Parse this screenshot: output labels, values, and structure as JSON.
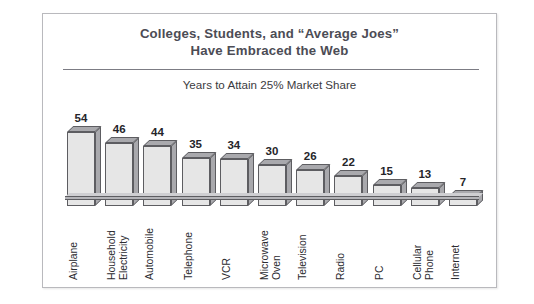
{
  "figure": {
    "title_line_1": "Colleges, Students, and “Average Joes”",
    "title_line_2": "Have Embraced the Web",
    "subtitle": "Years to Attain 25% Market Share"
  },
  "colors": {
    "title": "#4c4c55",
    "subtitle": "#3b3b41",
    "rule": "#7c7c84",
    "bar_front": "#e6e6e6",
    "bar_shade": "#a9a9ad",
    "bar_outline": "#5d5d61",
    "frame_border": "#b9b9bd",
    "background": "#ffffff"
  },
  "chart_data": {
    "type": "bar",
    "title": "Colleges, Students, and “Average Joes” Have Embraced the Web",
    "subtitle": "Years to Attain 25% Market Share",
    "xlabel": "",
    "ylabel": "Years to Attain 25% Market Share",
    "ylim": [
      0,
      54
    ],
    "grid": false,
    "legend": false,
    "categories": [
      "Airplane",
      "Household Electricity",
      "Automobile",
      "Telephone",
      "VCR",
      "Microwave Oven",
      "Television",
      "Radio",
      "PC",
      "Cellular Phone",
      "Internet"
    ],
    "values": [
      54,
      46,
      44,
      35,
      34,
      30,
      26,
      22,
      15,
      13,
      7
    ],
    "bars": [
      {
        "label": "Airplane",
        "label_lines": [
          "Airplane"
        ],
        "value": 54,
        "value_text": "54"
      },
      {
        "label": "Household Electricity",
        "label_lines": [
          "Household",
          "Electricity"
        ],
        "value": 46,
        "value_text": "46"
      },
      {
        "label": "Automobile",
        "label_lines": [
          "Automobile"
        ],
        "value": 44,
        "value_text": "44"
      },
      {
        "label": "Telephone",
        "label_lines": [
          "Telephone"
        ],
        "value": 35,
        "value_text": "35"
      },
      {
        "label": "VCR",
        "label_lines": [
          "VCR"
        ],
        "value": 34,
        "value_text": "34"
      },
      {
        "label": "Microwave Oven",
        "label_lines": [
          "Microwave",
          "Oven"
        ],
        "value": 30,
        "value_text": "30"
      },
      {
        "label": "Television",
        "label_lines": [
          "Television"
        ],
        "value": 26,
        "value_text": "26"
      },
      {
        "label": "Radio",
        "label_lines": [
          "Radio"
        ],
        "value": 22,
        "value_text": "22"
      },
      {
        "label": "PC",
        "label_lines": [
          "PC"
        ],
        "value": 15,
        "value_text": "15"
      },
      {
        "label": "Cellular Phone",
        "label_lines": [
          "Cellular",
          "Phone"
        ],
        "value": 13,
        "value_text": "13"
      },
      {
        "label": "Internet",
        "label_lines": [
          "Internet"
        ],
        "value": 7,
        "value_text": "7"
      }
    ]
  }
}
